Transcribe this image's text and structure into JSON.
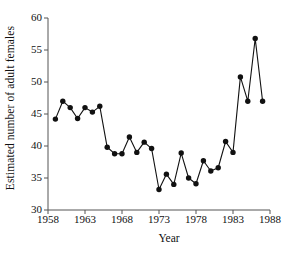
{
  "chart_data": {
    "type": "line",
    "title": "",
    "xlabel": "Year",
    "ylabel": "Estimated number of adult females",
    "xlim": [
      1958,
      1988
    ],
    "ylim": [
      30,
      60
    ],
    "xticks": [
      1958,
      1963,
      1968,
      1973,
      1978,
      1983,
      1988
    ],
    "xtick_labels": [
      "1958",
      "1963",
      "1968",
      "1973",
      "1978",
      "1983",
      "1988"
    ],
    "yticks": [
      30,
      35,
      40,
      45,
      50,
      55,
      60
    ],
    "ytick_labels": [
      "30",
      "35",
      "40",
      "45",
      "50",
      "55",
      "60"
    ],
    "grid": false,
    "legend": null,
    "marker": "filled-circle",
    "line_color": "#111111",
    "marker_color": "#111111",
    "axis_color": "#555555",
    "background": "#ffffff",
    "x": [
      1959,
      1960,
      1961,
      1962,
      1963,
      1964,
      1965,
      1966,
      1967,
      1968,
      1969,
      1970,
      1971,
      1972,
      1973,
      1974,
      1975,
      1976,
      1977,
      1978,
      1979,
      1980,
      1981,
      1982,
      1983,
      1984,
      1985,
      1986,
      1987
    ],
    "values": [
      44.2,
      47.0,
      46.0,
      44.3,
      46.0,
      45.3,
      46.2,
      39.8,
      38.8,
      38.8,
      41.4,
      39.0,
      40.6,
      39.6,
      33.2,
      35.6,
      34.0,
      38.9,
      35.0,
      34.1,
      37.7,
      36.1,
      36.6,
      40.7,
      39.0,
      50.8,
      47.0,
      56.8,
      47.0
    ],
    "series": [
      {
        "name": "Estimated number of adult females",
        "values": [
          44.2,
          47.0,
          46.0,
          44.3,
          46.0,
          45.3,
          46.2,
          39.8,
          38.8,
          38.8,
          41.4,
          39.0,
          40.6,
          39.6,
          33.2,
          35.6,
          34.0,
          38.9,
          35.0,
          34.1,
          37.7,
          36.1,
          36.6,
          40.7,
          39.0,
          50.8,
          47.0,
          56.8,
          47.0
        ]
      }
    ]
  }
}
